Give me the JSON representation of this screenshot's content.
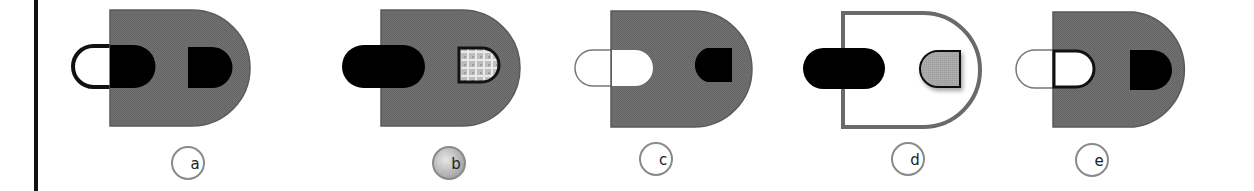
{
  "colors": {
    "shape_fill": "#6e6e6e",
    "shape_stroke": "#5a5a5a",
    "black": "#000000",
    "white": "#ffffff",
    "light_gray": "#a9a9a9",
    "label_ring": "#8a8a8a",
    "label_selected_fill": "#c4c4c4"
  },
  "options": [
    {
      "id": "a",
      "label": "a",
      "selected": false
    },
    {
      "id": "b",
      "label": "b",
      "selected": true
    },
    {
      "id": "c",
      "label": "c",
      "selected": false
    },
    {
      "id": "d",
      "label": "d",
      "selected": false
    },
    {
      "id": "e",
      "label": "e",
      "selected": false
    }
  ]
}
